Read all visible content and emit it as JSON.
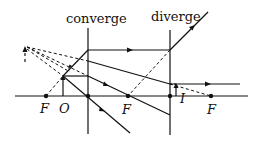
{
  "labels": {
    "converge": "converge",
    "diverge": "diverge",
    "focal_left": "F",
    "object": "O",
    "focal_middle": "F",
    "image": "I",
    "focal_right": "F"
  },
  "colors": {
    "ink": "#111111",
    "background": "#ffffff"
  },
  "geometry": {
    "axis_y": 96,
    "converging_lens_x": 88,
    "diverging_lens_x": 170,
    "object_x": 63,
    "image_x": 176,
    "focal_points_x": [
      46,
      128,
      211
    ]
  }
}
